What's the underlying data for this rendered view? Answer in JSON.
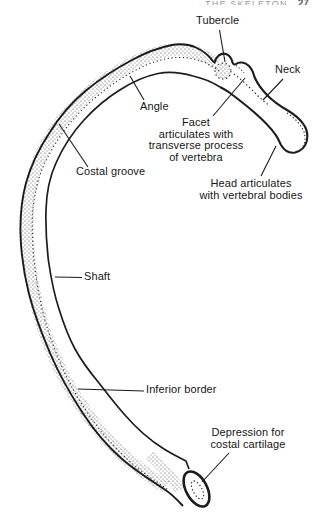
{
  "page_header": {
    "cropped_text": "THE SKELETON",
    "page_number": "27"
  },
  "diagram": {
    "labels": {
      "tubercle": "Tubercle",
      "neck": "Neck",
      "angle": "Angle",
      "facet": "Facet\narticulates with\ntransverse process\nof vertebra",
      "costal_groove": "Costal groove",
      "head": "Head articulates\nwith vertebral bodies",
      "shaft": "Shaft",
      "inferior_border": "Inferior border",
      "depression": "Depression for\ncostal cartilage"
    },
    "colors": {
      "ink": "#1c1c1c",
      "paper": "#ffffff",
      "stipple": "#3a3a3a"
    }
  }
}
